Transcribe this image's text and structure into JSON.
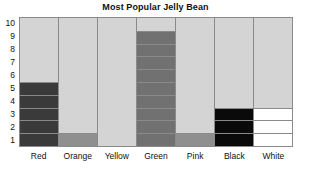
{
  "chart_data": {
    "type": "bar",
    "title": "Most Popular Jelly Bean",
    "xlabel": "",
    "ylabel": "",
    "categories": [
      "Red",
      "Orange",
      "Yellow",
      "Green",
      "Pink",
      "Black",
      "White"
    ],
    "values": [
      5,
      1,
      0,
      9,
      1,
      3,
      3
    ],
    "ylim": [
      0,
      10
    ],
    "yticks": [
      10,
      9,
      8,
      7,
      6,
      5,
      4,
      3,
      2,
      1
    ],
    "grid": true,
    "legend": "none",
    "bar_colors": [
      "#3a3a3a",
      "#8f8f8f",
      "#d4d4d4",
      "#717171",
      "#8f8f8f",
      "#0a0a0a",
      "#ffffff"
    ],
    "empty_color": "#d4d4d4",
    "grid_color": "#8a8a8a",
    "text_color": "#111111"
  }
}
